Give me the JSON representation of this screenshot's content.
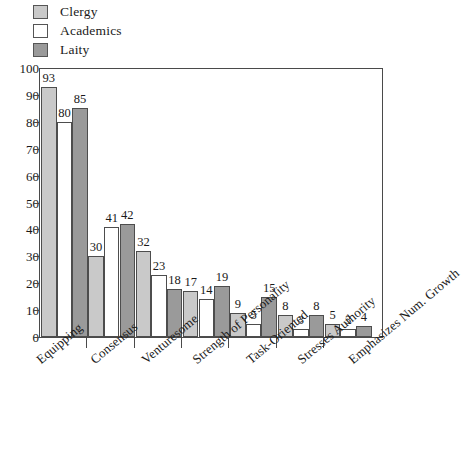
{
  "chart_data": {
    "type": "bar",
    "title": "",
    "xlabel": "",
    "ylabel": "",
    "ylim": [
      0,
      100
    ],
    "ytick_step": 10,
    "yticks": [
      100,
      90,
      80,
      70,
      60,
      50,
      40,
      30,
      20,
      10,
      0
    ],
    "grid": false,
    "legend_position": "top-left",
    "categories": [
      "Equipping",
      "Consensus",
      "Venturesome",
      "Strength of Personality",
      "Task-Oriented",
      "Stresses Authority",
      "Emphasizes Num. Growth"
    ],
    "series": [
      {
        "name": "Clergy",
        "color": "#c9c9c9",
        "values": [
          93,
          30,
          32,
          17,
          9,
          8,
          5
        ]
      },
      {
        "name": "Academics",
        "color": "#ffffff",
        "values": [
          80,
          41,
          23,
          14,
          5,
          3,
          3
        ]
      },
      {
        "name": "Laity",
        "color": "#9a9a9a",
        "values": [
          85,
          42,
          18,
          19,
          15,
          8,
          4
        ]
      }
    ]
  },
  "legend": {
    "items": [
      {
        "label": "Clergy",
        "color": "#c9c9c9"
      },
      {
        "label": "Academics",
        "color": "#ffffff"
      },
      {
        "label": "Laity",
        "color": "#9a9a9a"
      }
    ]
  },
  "axis": {
    "border_color": "#4a4a4a",
    "bar_outline_color": "#4d4d4d"
  }
}
